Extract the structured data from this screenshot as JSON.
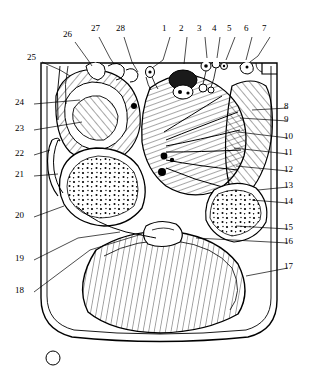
{
  "figure": {
    "type": "anatomical-cross-section-diagram",
    "title": "",
    "caption": "",
    "style": "black-and-white line drawing with hatching",
    "leader_line_color": "#000000",
    "outline_color": "#000000",
    "background_color": "#ffffff"
  },
  "labels": [
    {
      "id": "1",
      "text": "1",
      "x": 168,
      "y": 29,
      "side": "top"
    },
    {
      "id": "2",
      "text": "2",
      "x": 185,
      "y": 29,
      "side": "top"
    },
    {
      "id": "3",
      "text": "3",
      "x": 203,
      "y": 29,
      "side": "top"
    },
    {
      "id": "4",
      "text": "4",
      "x": 218,
      "y": 29,
      "side": "top"
    },
    {
      "id": "5",
      "text": "5",
      "x": 233,
      "y": 29,
      "side": "top"
    },
    {
      "id": "6",
      "text": "6",
      "x": 250,
      "y": 29,
      "side": "top"
    },
    {
      "id": "7",
      "text": "7",
      "x": 268,
      "y": 29,
      "side": "top"
    },
    {
      "id": "8",
      "text": "8",
      "x": 290,
      "y": 107,
      "side": "right"
    },
    {
      "id": "9",
      "text": "9",
      "x": 290,
      "y": 120,
      "side": "right"
    },
    {
      "id": "10",
      "text": "10",
      "x": 290,
      "y": 137,
      "side": "right"
    },
    {
      "id": "11",
      "text": "11",
      "x": 290,
      "y": 153,
      "side": "right"
    },
    {
      "id": "12",
      "text": "12",
      "x": 290,
      "y": 170,
      "side": "right"
    },
    {
      "id": "13",
      "text": "13",
      "x": 290,
      "y": 186,
      "side": "right"
    },
    {
      "id": "14",
      "text": "14",
      "x": 290,
      "y": 202,
      "side": "right"
    },
    {
      "id": "15",
      "text": "15",
      "x": 290,
      "y": 228,
      "side": "right"
    },
    {
      "id": "16",
      "text": "16",
      "x": 290,
      "y": 242,
      "side": "right"
    },
    {
      "id": "17",
      "text": "17",
      "x": 290,
      "y": 267,
      "side": "right"
    },
    {
      "id": "18",
      "text": "18",
      "x": 21,
      "y": 291,
      "side": "left"
    },
    {
      "id": "19",
      "text": "19",
      "x": 21,
      "y": 259,
      "side": "left"
    },
    {
      "id": "20",
      "text": "20",
      "x": 21,
      "y": 216,
      "side": "left"
    },
    {
      "id": "21",
      "text": "21",
      "x": 21,
      "y": 175,
      "side": "left"
    },
    {
      "id": "22",
      "text": "22",
      "x": 21,
      "y": 154,
      "side": "left"
    },
    {
      "id": "23",
      "text": "23",
      "x": 21,
      "y": 129,
      "side": "left"
    },
    {
      "id": "24",
      "text": "24",
      "x": 21,
      "y": 103,
      "side": "left"
    },
    {
      "id": "25",
      "text": "25",
      "x": 33,
      "y": 58,
      "side": "left"
    },
    {
      "id": "26",
      "text": "26",
      "x": 69,
      "y": 35,
      "side": "top"
    },
    {
      "id": "27",
      "text": "27",
      "x": 97,
      "y": 29,
      "side": "top"
    },
    {
      "id": "28",
      "text": "28",
      "x": 122,
      "y": 29,
      "side": "top"
    }
  ],
  "footer": {
    "marker": "circle-mark"
  }
}
